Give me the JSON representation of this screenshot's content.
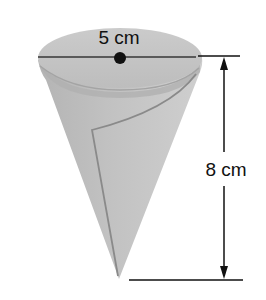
{
  "figure": {
    "diameter_label": "5 cm",
    "height_label": "8 cm"
  },
  "colors": {
    "background": "#ffffff",
    "cone_body": "#bdbdbd",
    "cone_top": "#c8c8c8",
    "rim_shadow": "#a9a9a9",
    "fold_line": "#8a8a8a",
    "diameter_line": "#5a5a5a",
    "center_dot": "#111111",
    "dimension_line": "#111111"
  }
}
